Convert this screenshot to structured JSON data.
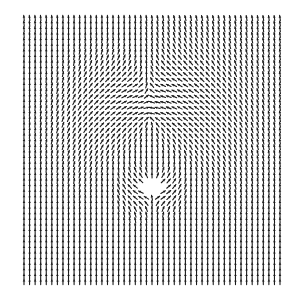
{
  "chart_data": {
    "type": "quiver",
    "title": "",
    "xlabel": "",
    "ylabel": "",
    "grid_cols": 47,
    "grid_rows": 48,
    "x_range_px": [
      24,
      280
    ],
    "y_range_px": [
      18,
      282
    ],
    "arrow_color": "#1a1a1a",
    "background": "#ffffff",
    "base_flow": {
      "dx": 0,
      "dy": -1,
      "description": "uniform upward flow"
    },
    "features": [
      {
        "kind": "sink",
        "center_px": [
          150,
          118
        ],
        "strength": 1.6,
        "radius_px": 55,
        "description": "convergent region above center, arrows curve inward toward vertical centerline"
      },
      {
        "kind": "source",
        "center_px": [
          152,
          183
        ],
        "strength": 2.2,
        "radius_px": 22,
        "description": "diverging splash with blank core below center"
      }
    ],
    "blank_core": {
      "center_px": [
        152,
        186
      ],
      "rx": 13,
      "ry": 8
    }
  }
}
